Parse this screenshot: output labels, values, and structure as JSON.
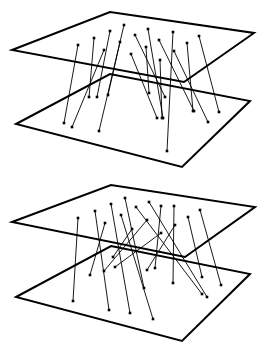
{
  "diagram": {
    "colors": {
      "plane_stroke": "#000000",
      "line_stroke": "#000000",
      "dot_fill": "#000000",
      "background": "#ffffff"
    },
    "panels": [
      {
        "name": "panel-top",
        "planes": [
          {
            "name": "upper-plane",
            "corners": [
              [
                12,
                50
              ],
              [
                110,
                12
              ],
              [
                254,
                33
              ],
              [
                184,
                82
              ]
            ]
          },
          {
            "name": "lower-plane",
            "corners": [
              [
                16,
                124
              ],
              [
                110,
                74
              ],
              [
                250,
                101
              ],
              [
                182,
                167
              ]
            ]
          }
        ],
        "connections": [
          [
            [
              78,
              45
            ],
            [
              64,
              123
            ]
          ],
          [
            [
              104,
              50
            ],
            [
              72,
              127
            ]
          ],
          [
            [
              94,
              38
            ],
            [
              89,
              97
            ]
          ],
          [
            [
              110,
              31
            ],
            [
              97,
              97
            ]
          ],
          [
            [
              124,
              25
            ],
            [
              99,
              131
            ]
          ],
          [
            [
              120,
              42
            ],
            [
              108,
              95
            ]
          ],
          [
            [
              148,
              29
            ],
            [
              163,
              118
            ]
          ],
          [
            [
              135,
              35
            ],
            [
              165,
              97
            ]
          ],
          [
            [
              131,
              54
            ],
            [
              157,
              118
            ]
          ],
          [
            [
              146,
              47
            ],
            [
              149,
              93
            ]
          ],
          [
            [
              160,
              60
            ],
            [
              162,
              118
            ]
          ],
          [
            [
              173,
              32
            ],
            [
              167,
              151
            ]
          ],
          [
            [
              159,
              40
            ],
            [
              194,
              111
            ]
          ],
          [
            [
              174,
              51
            ],
            [
              208,
              122
            ]
          ],
          [
            [
              187,
              43
            ],
            [
              193,
              111
            ]
          ],
          [
            [
              199,
              36
            ],
            [
              219,
              112
            ]
          ]
        ]
      },
      {
        "name": "panel-bottom",
        "planes": [
          {
            "name": "upper-plane",
            "corners": [
              [
                12,
                222
              ],
              [
                111,
                185
              ],
              [
                255,
                207
              ],
              [
                185,
                257
              ]
            ]
          },
          {
            "name": "lower-plane",
            "corners": [
              [
                16,
                297
              ],
              [
                111,
                246
              ],
              [
                250,
                274
              ],
              [
                182,
                341
              ]
            ]
          }
        ],
        "connections": [
          [
            [
              78,
              218
            ],
            [
              73,
              301
            ]
          ],
          [
            [
              95,
              211
            ],
            [
              109,
              310
            ]
          ],
          [
            [
              105,
              223
            ],
            [
              90,
              275
            ]
          ],
          [
            [
              111,
              204
            ],
            [
              130,
              313
            ]
          ],
          [
            [
              125,
              198
            ],
            [
              144,
              288
            ]
          ],
          [
            [
              121,
              215
            ],
            [
              153,
              319
            ]
          ],
          [
            [
              136,
              207
            ],
            [
              202,
              294
            ]
          ],
          [
            [
              149,
              202
            ],
            [
              207,
              297
            ]
          ],
          [
            [
              132,
              229
            ],
            [
              113,
              257
            ]
          ],
          [
            [
              147,
              220
            ],
            [
              104,
              271
            ]
          ],
          [
            [
              161,
              233
            ],
            [
              115,
              267
            ]
          ],
          [
            [
              161,
              206
            ],
            [
              155,
              268
            ]
          ],
          [
            [
              175,
              225
            ],
            [
              147,
              270
            ]
          ],
          [
            [
              174,
              206
            ],
            [
              173,
              283
            ]
          ],
          [
            [
              188,
              217
            ],
            [
              202,
              277
            ]
          ],
          [
            [
              200,
              210
            ],
            [
              221,
              285
            ]
          ]
        ]
      }
    ]
  }
}
